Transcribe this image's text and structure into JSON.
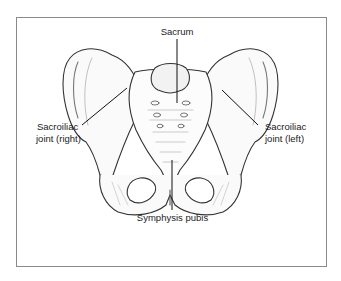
{
  "figure": {
    "labels": {
      "sacrum": "Sacrum",
      "si_right_line1": "Sacroiliac",
      "si_right_line2": "joint (right)",
      "si_left_line1": "Sacroiliac",
      "si_left_line2": "joint (left)",
      "symphysis": "Symphysis pubis"
    }
  }
}
